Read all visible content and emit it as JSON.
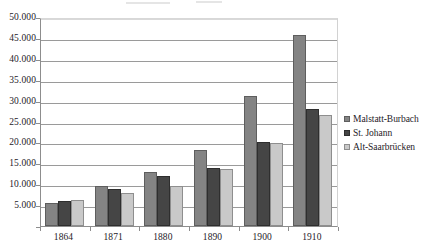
{
  "chart_data": {
    "type": "bar",
    "title": "",
    "subtitle": "",
    "xlabel": "",
    "ylabel": "",
    "categories": [
      "1864",
      "1871",
      "1880",
      "1890",
      "1900",
      "1910"
    ],
    "series": [
      {
        "name": "Malstatt-Burbach",
        "color": "#848484",
        "values": [
          5600,
          9500,
          13000,
          18300,
          31000,
          45700
        ]
      },
      {
        "name": "St. Johann",
        "color": "#454545",
        "values": [
          6100,
          8800,
          12000,
          13800,
          20200,
          28000
        ]
      },
      {
        "name": "Alt-Saarbrücken",
        "color": "#c9c9c9",
        "values": [
          6300,
          7800,
          9500,
          13700,
          19900,
          26500
        ]
      }
    ],
    "ylim": [
      0,
      50000
    ],
    "yticks": [
      0,
      5000,
      10000,
      15000,
      20000,
      25000,
      30000,
      35000,
      40000,
      45000,
      50000
    ],
    "ytick_labels": [
      "",
      "5.000",
      "10.000",
      "15.000",
      "20.000",
      "25.000",
      "30.000",
      "35.000",
      "40.000",
      "45.000",
      "50.000"
    ],
    "grid": true,
    "grid_axis": "y",
    "legend_position": "right",
    "annotations": []
  }
}
